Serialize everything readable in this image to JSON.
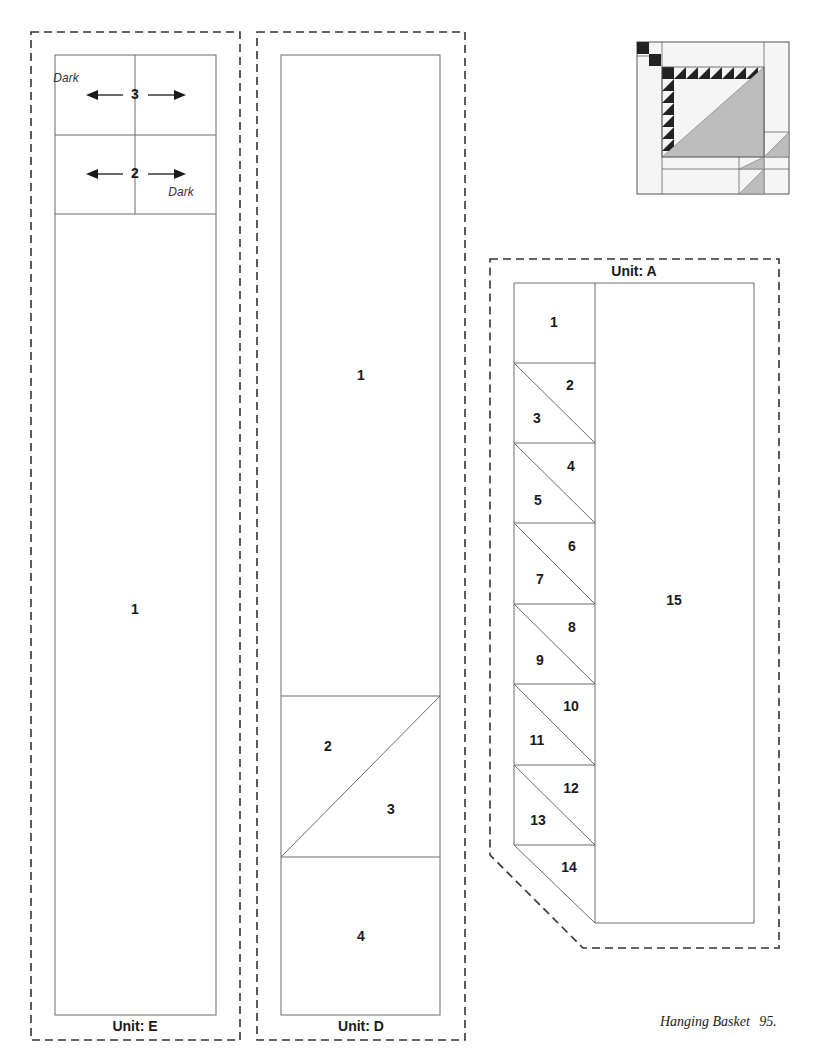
{
  "page": {
    "footer_title": "Hanging Basket",
    "page_number": "95.",
    "colors": {
      "outline": "#6b6b6b",
      "dash": "#333333",
      "text": "#1a1a1a",
      "thumb_dark": "#222222",
      "thumb_mid": "#bdbdbd",
      "thumb_light": "#f5f5f5"
    }
  },
  "unit_e": {
    "label": "Unit: E",
    "pieces": [
      {
        "number": "3",
        "note": "Dark"
      },
      {
        "number": "2",
        "note": "Dark"
      },
      {
        "number": "1"
      }
    ]
  },
  "unit_d": {
    "label": "Unit: D",
    "pieces": [
      {
        "number": "1"
      },
      {
        "number": "2"
      },
      {
        "number": "3"
      },
      {
        "number": "4"
      }
    ]
  },
  "unit_a": {
    "label": "Unit: A",
    "pieces": [
      {
        "number": "1"
      },
      {
        "number": "2"
      },
      {
        "number": "3"
      },
      {
        "number": "4"
      },
      {
        "number": "5"
      },
      {
        "number": "6"
      },
      {
        "number": "7"
      },
      {
        "number": "8"
      },
      {
        "number": "9"
      },
      {
        "number": "10"
      },
      {
        "number": "11"
      },
      {
        "number": "12"
      },
      {
        "number": "13"
      },
      {
        "number": "14"
      },
      {
        "number": "15"
      }
    ]
  },
  "thumbnail": {
    "alt": "Hanging Basket block preview"
  }
}
